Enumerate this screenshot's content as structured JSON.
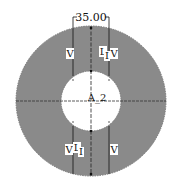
{
  "diagram": {
    "colors": {
      "ring_fill": "#8a8a8a",
      "hole_fill": "#ffffff",
      "line": "#222222",
      "label_bg": "#ffffff"
    },
    "outer_circle": {
      "cx": 91,
      "cy": 101,
      "r": 75
    },
    "inner_circle": {
      "cx": 91,
      "cy": 101,
      "r": 30
    },
    "dimension": {
      "label": "35.00",
      "x1": 73,
      "x2": 109,
      "y": 17
    },
    "center_label": "A_2",
    "labels": {
      "top_left_v": "V",
      "top_right_l": "L",
      "top_right_sub": "I",
      "top_right_v": "V",
      "bottom_left_v": "V",
      "bottom_left_l": "L",
      "bottom_left_sub": "I",
      "bottom_right_v": "V"
    }
  }
}
